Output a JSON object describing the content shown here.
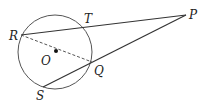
{
  "diagram": {
    "type": "geometry",
    "circle": {
      "center": [
        55,
        52
      ],
      "radius": 37,
      "stroke": "#555555"
    },
    "points": {
      "R": {
        "label": "R",
        "pos": [
          21,
          35
        ],
        "label_pos": [
          9,
          40
        ]
      },
      "T": {
        "label": "T",
        "pos": [
          83,
          28
        ],
        "label_pos": [
          84,
          23
        ]
      },
      "P": {
        "label": "P",
        "pos": [
          186,
          15
        ],
        "label_pos": [
          190,
          19
        ]
      },
      "Q": {
        "label": "Q",
        "pos": [
          92,
          62
        ],
        "label_pos": [
          95,
          75
        ]
      },
      "S": {
        "label": "S",
        "pos": [
          43,
          87
        ],
        "label_pos": [
          36,
          100
        ]
      },
      "O": {
        "label": "O",
        "pos": [
          56,
          51
        ],
        "label_pos": [
          41,
          65
        ]
      }
    },
    "segments": [
      {
        "from": "R",
        "to": "P",
        "style": "solid"
      },
      {
        "from": "S",
        "to": "P",
        "style": "solid"
      },
      {
        "from": "R",
        "to": "Q",
        "style": "dashed"
      }
    ],
    "line_color": "#333333"
  }
}
